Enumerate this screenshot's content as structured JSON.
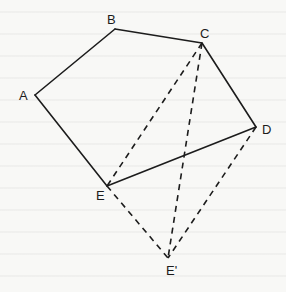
{
  "figure": {
    "title": "",
    "background": "#f8f8f6",
    "stroke_color": "#1c1c1c"
  },
  "vertices": [
    {
      "id": "A",
      "label": "A",
      "x": 35,
      "y": 95,
      "label_x": 19,
      "label_y": 100
    },
    {
      "id": "B",
      "label": "B",
      "x": 115,
      "y": 29,
      "label_x": 107,
      "label_y": 24
    },
    {
      "id": "C",
      "label": "C",
      "x": 202,
      "y": 43,
      "label_x": 200,
      "label_y": 38
    },
    {
      "id": "D",
      "label": "D",
      "x": 256,
      "y": 127,
      "label_x": 262,
      "label_y": 134
    },
    {
      "id": "E",
      "label": "E",
      "x": 107,
      "y": 186,
      "label_x": 96,
      "label_y": 200
    },
    {
      "id": "E_prime",
      "label": "E'",
      "x": 168,
      "y": 258,
      "label_x": 166,
      "label_y": 275
    }
  ],
  "edges": [
    {
      "from": "A",
      "to": "B",
      "style": "solid"
    },
    {
      "from": "B",
      "to": "C",
      "style": "solid"
    },
    {
      "from": "C",
      "to": "D",
      "style": "solid"
    },
    {
      "from": "D",
      "to": "E",
      "style": "solid"
    },
    {
      "from": "E",
      "to": "A",
      "style": "solid"
    },
    {
      "from": "C",
      "to": "E",
      "style": "dashed"
    },
    {
      "from": "C",
      "to": "E_prime",
      "style": "dashed"
    },
    {
      "from": "E",
      "to": "E_prime",
      "style": "dashed"
    },
    {
      "from": "D",
      "to": "E_prime",
      "style": "dashed"
    }
  ]
}
